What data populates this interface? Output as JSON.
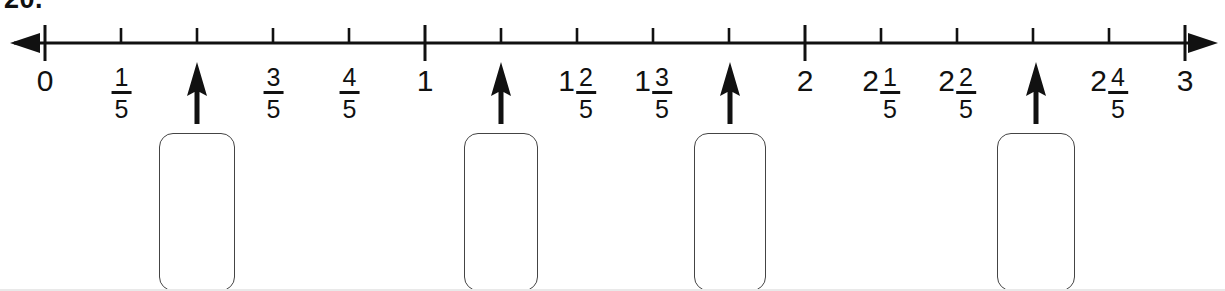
{
  "item": {
    "number_label": "20."
  },
  "number_line": {
    "start_value": 0,
    "end_value": 3,
    "denominator": 5,
    "axis_y": 43,
    "origin_x": 45,
    "step_px": 76,
    "left_arrow": "left-arrowhead",
    "right_arrow": "right-arrowhead",
    "stroke_color": "#111111"
  },
  "ticks": [
    {
      "index": 0,
      "value": "0",
      "x": 45,
      "major": true,
      "label": "0",
      "whole": "0",
      "num": "",
      "den": ""
    },
    {
      "index": 1,
      "value": "1/5",
      "x": 121,
      "major": false,
      "label": "1/5",
      "whole": "",
      "num": "1",
      "den": "5"
    },
    {
      "index": 2,
      "value": "2/5",
      "x": 197,
      "major": false,
      "label": "",
      "whole": "",
      "num": "",
      "den": ""
    },
    {
      "index": 3,
      "value": "3/5",
      "x": 273,
      "major": false,
      "label": "3/5",
      "whole": "",
      "num": "3",
      "den": "5"
    },
    {
      "index": 4,
      "value": "4/5",
      "x": 349,
      "major": false,
      "label": "4/5",
      "whole": "",
      "num": "4",
      "den": "5"
    },
    {
      "index": 5,
      "value": "1",
      "x": 425,
      "major": true,
      "label": "1",
      "whole": "1",
      "num": "",
      "den": ""
    },
    {
      "index": 6,
      "value": "1 1/5",
      "x": 501,
      "major": false,
      "label": "",
      "whole": "",
      "num": "",
      "den": ""
    },
    {
      "index": 7,
      "value": "1 2/5",
      "x": 577,
      "major": false,
      "label": "1 2/5",
      "whole": "1",
      "num": "2",
      "den": "5"
    },
    {
      "index": 8,
      "value": "1 3/5",
      "x": 653,
      "major": false,
      "label": "1 3/5",
      "whole": "1",
      "num": "3",
      "den": "5"
    },
    {
      "index": 9,
      "value": "1 4/5",
      "x": 729,
      "major": false,
      "label": "",
      "whole": "",
      "num": "",
      "den": ""
    },
    {
      "index": 10,
      "value": "2",
      "x": 805,
      "major": true,
      "label": "2",
      "whole": "2",
      "num": "",
      "den": ""
    },
    {
      "index": 11,
      "value": "2 1/5",
      "x": 881,
      "major": false,
      "label": "2 1/5",
      "whole": "2",
      "num": "1",
      "den": "5"
    },
    {
      "index": 12,
      "value": "2 2/5",
      "x": 957,
      "major": false,
      "label": "2 2/5",
      "whole": "2",
      "num": "2",
      "den": "5"
    },
    {
      "index": 13,
      "value": "2 3/5",
      "x": 1033,
      "major": false,
      "label": "",
      "whole": "",
      "num": "",
      "den": ""
    },
    {
      "index": 14,
      "value": "2 4/5",
      "x": 1109,
      "major": false,
      "label": "2 4/5",
      "whole": "2",
      "num": "4",
      "den": "5"
    },
    {
      "index": 15,
      "value": "3",
      "x": 1185,
      "major": true,
      "label": "3",
      "whole": "3",
      "num": "",
      "den": ""
    }
  ],
  "pointers": [
    {
      "id": 1,
      "points_to_value": "2/5",
      "x": 197,
      "tick_index": 2
    },
    {
      "id": 2,
      "points_to_value": "1 1/5",
      "x": 501,
      "tick_index": 6
    },
    {
      "id": 3,
      "points_to_value": "1 4/5",
      "x": 730,
      "tick_index": 9
    },
    {
      "id": 4,
      "points_to_value": "2 3/5",
      "x": 1036,
      "tick_index": 13
    }
  ],
  "answer_boxes": [
    {
      "id": 1,
      "x": 197,
      "y": 133,
      "width": 76,
      "height": 158,
      "value": ""
    },
    {
      "id": 2,
      "x": 501,
      "y": 133,
      "width": 74,
      "height": 158,
      "value": ""
    },
    {
      "id": 3,
      "x": 730,
      "y": 133,
      "width": 72,
      "height": 158,
      "value": ""
    },
    {
      "id": 4,
      "x": 1036,
      "y": 133,
      "width": 78,
      "height": 158,
      "value": ""
    }
  ]
}
